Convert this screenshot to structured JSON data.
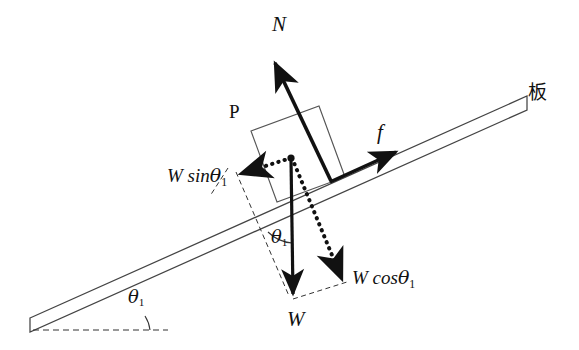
{
  "figure": {
    "background_color": "#ffffff",
    "stroke_color": "#111111",
    "plank_outline_color": "#444444",
    "width": 579,
    "height": 350
  },
  "labels": {
    "normal_force": "N",
    "board_cjk": "板",
    "block": "P",
    "friction": "f",
    "weight_parallel": "W sin",
    "weight_parallel_theta": "θ",
    "weight_parallel_sub": "1",
    "weight_perpendicular": "W cos",
    "weight_perpendicular_theta": "θ",
    "weight_perpendicular_sub": "1",
    "weight": "W",
    "theta_symbol": "θ",
    "theta_subscript": "1"
  },
  "geometry": {
    "incline_angle_deg": 18,
    "plank_lower_left": [
      30,
      318
    ],
    "plank_upper_right": [
      527,
      96
    ],
    "origin_point": [
      291,
      158
    ],
    "contact_point": [
      330,
      180
    ]
  },
  "vectors": [
    {
      "name": "normal-force",
      "label": "N",
      "style": "solid-bold",
      "from": [
        330,
        180
      ],
      "to": [
        272,
        57
      ],
      "description": "Normal force perpendicular to incline surface, pointing away from board"
    },
    {
      "name": "friction-force",
      "label": "f",
      "style": "solid-bold",
      "from": [
        330,
        180
      ],
      "to": [
        402,
        148
      ],
      "description": "Friction force along incline surface, pointing up the slope"
    },
    {
      "name": "weight",
      "label": "W",
      "style": "solid-bold",
      "from": [
        291,
        158
      ],
      "to": [
        293,
        300
      ],
      "description": "Weight acting vertically downward"
    },
    {
      "name": "weight-parallel-component",
      "label": "W sin θ1",
      "style": "dotted-bold",
      "from": [
        291,
        158
      ],
      "to": [
        238,
        175
      ],
      "description": "Component of weight parallel to incline, down the slope direction"
    },
    {
      "name": "weight-perpendicular-component",
      "label": "W cos θ1",
      "style": "dotted-bold",
      "from": [
        291,
        158
      ],
      "to": [
        345,
        285
      ],
      "description": "Component of weight perpendicular to incline, into the board"
    }
  ],
  "construction_lines": [
    {
      "name": "horizontal-reference",
      "style": "dashed",
      "from": [
        35,
        322
      ],
      "to": [
        165,
        322
      ],
      "description": "Horizontal dashed reference line for incline angle"
    },
    {
      "name": "perpendicular-guide",
      "style": "dashed",
      "from": [
        232,
        176
      ],
      "to": [
        288,
        297
      ],
      "description": "Dashed guide parallel to perpendicular component"
    },
    {
      "name": "parallelogram-closure",
      "style": "dashed",
      "from": [
        293,
        300
      ],
      "to": [
        346,
        284
      ],
      "description": "Dashed closure of the decomposition parallelogram"
    }
  ],
  "angles": [
    {
      "name": "incline-angle",
      "label": "θ1",
      "vertex": [
        165,
        322
      ],
      "between": [
        "horizontal-reference",
        "plank-surface"
      ]
    },
    {
      "name": "weight-decomposition-angle",
      "label": "θ1",
      "vertex": [
        291,
        158
      ],
      "between": [
        "perpendicular-guide",
        "weight-vector"
      ]
    }
  ],
  "block": {
    "name": "block-P",
    "label": "P",
    "corners": [
      [
        251,
        131
      ],
      [
        319,
        106
      ],
      [
        345,
        177
      ],
      [
        277,
        202
      ]
    ],
    "description": "Rectangular block P resting on the inclined board"
  }
}
